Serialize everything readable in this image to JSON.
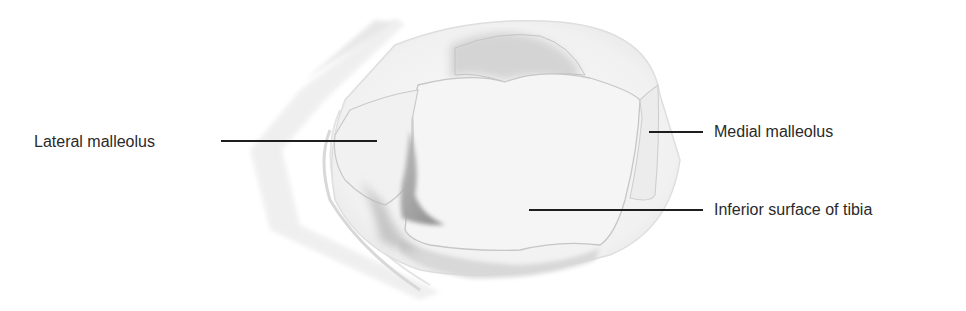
{
  "figure": {
    "colors": {
      "background": "#ffffff",
      "text": "#2a2a2a",
      "leader_line": "#1e1e1e",
      "bone_fill": "#f4f4f4",
      "bone_outline": "#c8c8c8",
      "shadow": "#9a9a9a"
    }
  },
  "labels": [
    {
      "id": "lateral-malleolus",
      "text": "Lateral malleolus",
      "side": "left"
    },
    {
      "id": "medial-malleolus",
      "text": "Medial malleolus",
      "side": "right"
    },
    {
      "id": "inferior-surface-tibia",
      "text": "Inferior surface of tibia",
      "side": "right"
    }
  ]
}
